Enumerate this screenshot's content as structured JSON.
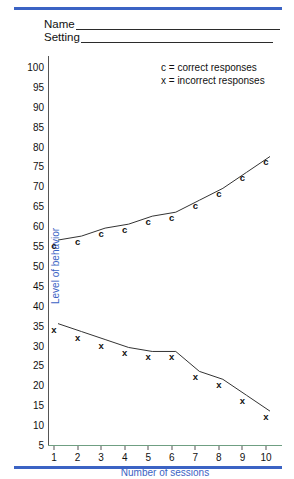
{
  "header": {
    "fields": [
      {
        "label": "Name",
        "value": ""
      },
      {
        "label": "Setting",
        "value": ""
      }
    ]
  },
  "legend": {
    "entries": [
      "c = correct responses",
      "x = incorrect responses"
    ]
  },
  "colors": {
    "rule": "#3b63c4",
    "axis_label": "#3b63c4",
    "data_line": "#333333",
    "baseline": "#6f9f82"
  },
  "chart_data": {
    "type": "line",
    "title": "",
    "xlabel": "Number of sessions",
    "ylabel": "Level of behavior",
    "x": [
      1,
      2,
      3,
      4,
      5,
      6,
      7,
      8,
      9,
      10
    ],
    "xlim": [
      1,
      10
    ],
    "ylim": [
      5,
      100
    ],
    "xticks": [
      "1",
      "2",
      "3",
      "4",
      "5",
      "6",
      "7",
      "8",
      "9",
      "10"
    ],
    "yticks": [
      "100",
      "95",
      "90",
      "85",
      "80",
      "75",
      "70",
      "65",
      "60",
      "55",
      "50",
      "45",
      "40",
      "35",
      "30",
      "25",
      "20",
      "15",
      "10",
      "5"
    ],
    "grid": false,
    "legend_position": "top-right",
    "series": [
      {
        "name": "c = correct responses",
        "marker": "c",
        "values": [
          55,
          56,
          58,
          59,
          61,
          62,
          65,
          68,
          72,
          76
        ]
      },
      {
        "name": "x = incorrect responses",
        "marker": "x",
        "values": [
          34,
          32,
          30,
          28,
          27,
          27,
          22,
          20,
          16,
          12
        ]
      }
    ]
  }
}
